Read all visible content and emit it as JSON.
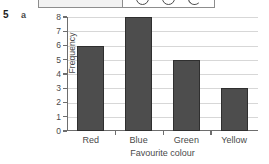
{
  "question": {
    "number": "5",
    "part": "a"
  },
  "cropped_panel": {
    "name": "cut-off-panel-above",
    "glyphs": [
      "circle-glyph",
      "circle-glyph",
      "partial-circle-glyph"
    ]
  },
  "colors": {
    "bar_fill": "#4d4d4d",
    "bar_stroke": "#2f2f2f",
    "axis": "#6e6e6e",
    "gridline": "#d7d7d7",
    "text": "#4a4a4a"
  },
  "chart_data": {
    "type": "bar",
    "title": "",
    "categories": [
      "Red",
      "Blue",
      "Green",
      "Yellow"
    ],
    "values": [
      6,
      8,
      5,
      3
    ],
    "xlabel": "Favourite colour",
    "ylabel": "Frequency",
    "ylim": [
      0,
      8
    ],
    "ytick_labels": [
      "0",
      "1",
      "2",
      "3",
      "4",
      "5",
      "6",
      "7",
      "8"
    ],
    "ytick_values": [
      0,
      1,
      2,
      3,
      4,
      5,
      6,
      7,
      8
    ],
    "grid": "horizontal",
    "legend": "none"
  }
}
